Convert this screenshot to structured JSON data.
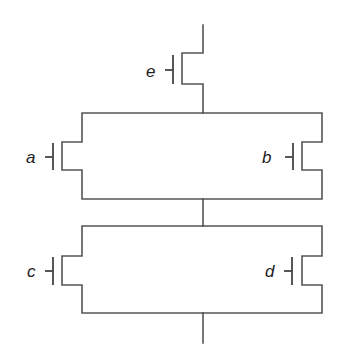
{
  "diagram": {
    "type": "transistor-network",
    "line_color": "#555555",
    "background": "#ffffff",
    "transistors": [
      {
        "id": "e",
        "label": "e",
        "position": "top-series"
      },
      {
        "id": "a",
        "label": "a",
        "position": "upper-parallel-left"
      },
      {
        "id": "b",
        "label": "b",
        "position": "upper-parallel-right"
      },
      {
        "id": "c",
        "label": "c",
        "position": "lower-parallel-left"
      },
      {
        "id": "d",
        "label": "d",
        "position": "lower-parallel-right"
      }
    ],
    "topology": "e in series with (a || b) in series with (c || d)"
  }
}
